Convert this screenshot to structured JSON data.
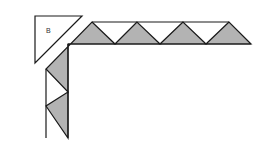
{
  "diagram": {
    "label_b": "B",
    "colors": {
      "background": "#ffffff",
      "fill_gray": "#b3b3b3",
      "stroke": "#1a1a1a"
    }
  }
}
